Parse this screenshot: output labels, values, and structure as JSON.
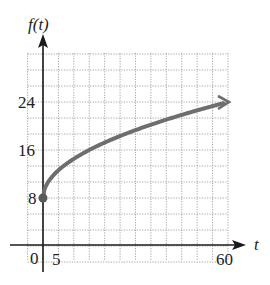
{
  "chart_data": {
    "type": "line",
    "title": "",
    "xlabel": "t",
    "ylabel": "f(t)",
    "x_ticks_labeled": [
      0,
      5,
      60
    ],
    "y_ticks_labeled": [
      8,
      16,
      24
    ],
    "x_grid_step": 5,
    "y_grid_step": 2.667,
    "xlim": [
      -1.25,
      60
    ],
    "ylim": [
      -2.67,
      32
    ],
    "grid": true,
    "grid_style": "dotted",
    "legend": null,
    "series": [
      {
        "name": "f(t)",
        "start_point_marked": true,
        "end_arrow": true,
        "x": [
          0,
          2,
          5,
          10,
          15,
          20,
          25,
          30,
          35,
          40,
          45,
          50,
          55,
          60
        ],
        "values": [
          8,
          10.9,
          12.6,
          14.5,
          16.0,
          17.3,
          18.3,
          19.3,
          20.2,
          21.1,
          21.9,
          22.6,
          23.3,
          24
        ]
      }
    ]
  },
  "labels": {
    "y_axis": "f(t)",
    "x_axis": "t",
    "origin": "0",
    "x_tick_5": "5",
    "x_tick_60": "60",
    "y_tick_8": "8",
    "y_tick_16": "16",
    "y_tick_24": "24"
  },
  "colors": {
    "axis": "#1a1a1a",
    "grid": "#9a9a9a",
    "curve": "#6e6e6e",
    "point": "#5a5a5a"
  }
}
